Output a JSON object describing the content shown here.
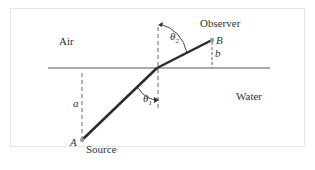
{
  "diagram": {
    "type": "refraction-geometry",
    "regions": {
      "upper": "Air",
      "lower": "Water"
    },
    "points": {
      "source": {
        "letter": "A",
        "label": "Source"
      },
      "observer": {
        "letter": "B",
        "label": "Observer"
      }
    },
    "distances": {
      "a": "a",
      "b": "b"
    },
    "angles": {
      "theta1": "θ",
      "theta1_sub": "1",
      "theta2": "θ",
      "theta2_sub": "2"
    },
    "colors": {
      "ray": "#2b2b2b",
      "interface": "#555555",
      "dashed": "#666666",
      "text": "#333333",
      "frame": "#e4e4e4",
      "point": "#9a9a9a"
    }
  }
}
